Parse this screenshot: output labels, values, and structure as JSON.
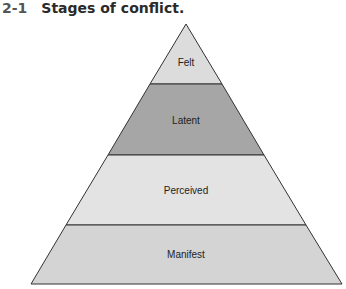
{
  "figure": {
    "number": "2-1",
    "title": "Stages of conflict."
  },
  "pyramid": {
    "levels": [
      {
        "label": "Felt",
        "color": "#dcdcdc"
      },
      {
        "label": "Latent",
        "color": "#a6a6a6"
      },
      {
        "label": "Perceived",
        "color": "#e3e3e3"
      },
      {
        "label": "Manifest",
        "color": "#d4d4d4"
      }
    ],
    "outline_color": "#333333"
  }
}
